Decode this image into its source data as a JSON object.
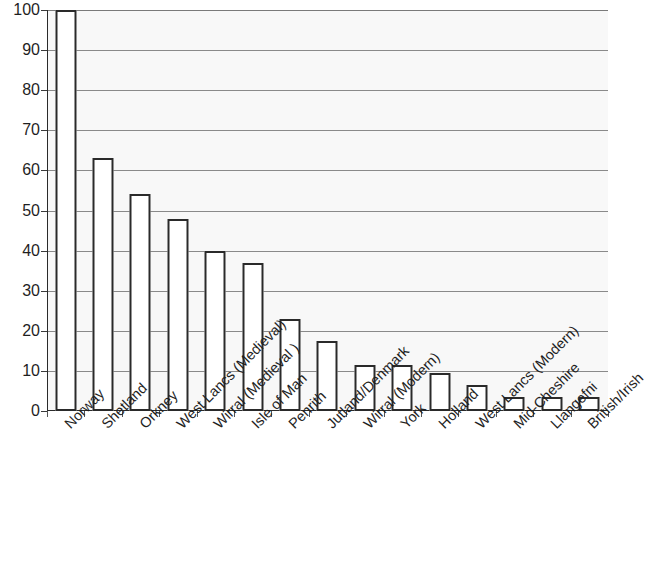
{
  "chart_data": {
    "type": "bar",
    "title": "",
    "subtitle": "",
    "xlabel": "",
    "ylabel": "",
    "ylim": [
      0,
      100
    ],
    "yticks": [
      0,
      10,
      20,
      30,
      40,
      50,
      60,
      70,
      80,
      90,
      100
    ],
    "ytick_labels": [
      "0",
      "10",
      "20",
      "30",
      "40",
      "50",
      "60",
      "70",
      "80",
      "90",
      "100"
    ],
    "grid": "horizontal",
    "legend": "none",
    "categories": [
      "Norway",
      "Shetland",
      "Orkney",
      "West Lancs (Medieval)",
      "Wirral (Medieval )",
      "Isle of Man",
      "Penrith",
      "Jutland/Denmark",
      "Wirral (Modern)",
      "York",
      "Holland",
      "West Lancs (Modern)",
      "Mid-Cheshire",
      "Llangefni",
      "British/Irish"
    ],
    "values": [
      100,
      63,
      54,
      48,
      40,
      37,
      23,
      17.5,
      11.5,
      11.5,
      9.5,
      6.5,
      3.5,
      3.5,
      3.5
    ],
    "bar_style": {
      "fill": "#ffffff",
      "edge": "#2a2a2a",
      "edge_width": 2
    },
    "axis_color": "#2b2b2b",
    "gridline_color": "#8a8a8a",
    "plot_background": "#f8f8f8",
    "label_rotation_degrees": -45
  }
}
